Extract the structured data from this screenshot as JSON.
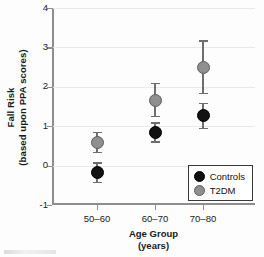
{
  "chart_data": {
    "type": "scatter",
    "title": "",
    "xlabel": "Age Group",
    "xlabel_units": "(years)",
    "ylabel_line1": "Fall Risk",
    "ylabel_line2": "(based upon PPA scores)",
    "categories": [
      "50–60",
      "60–70",
      "70–80"
    ],
    "ylim": [
      -1,
      4
    ],
    "yticks": [
      -1,
      0,
      1,
      2,
      3,
      4
    ],
    "ytick_labels": [
      "-1",
      "0",
      "1",
      "2",
      "3",
      "4"
    ],
    "grid": true,
    "grid_axis": "y",
    "legend_position": "bottom-right-inside",
    "series": [
      {
        "name": "Controls",
        "color": "#121212",
        "marker": "filled-circle",
        "values": [
          -0.17,
          0.86,
          1.29
        ],
        "err_low": [
          -0.42,
          0.62,
          0.96
        ],
        "err_high": [
          0.08,
          1.1,
          1.6
        ]
      },
      {
        "name": "T2DM",
        "color": "#8f8f8f",
        "marker": "gray-circle",
        "values": [
          0.6,
          1.67,
          2.5
        ],
        "err_low": [
          0.35,
          1.27,
          1.85
        ],
        "err_high": [
          0.85,
          2.1,
          3.18
        ]
      }
    ]
  },
  "legend": {
    "entries": [
      {
        "label": "Controls",
        "swatch": "controls"
      },
      {
        "label": "T2DM",
        "swatch": "t2dm"
      }
    ]
  }
}
